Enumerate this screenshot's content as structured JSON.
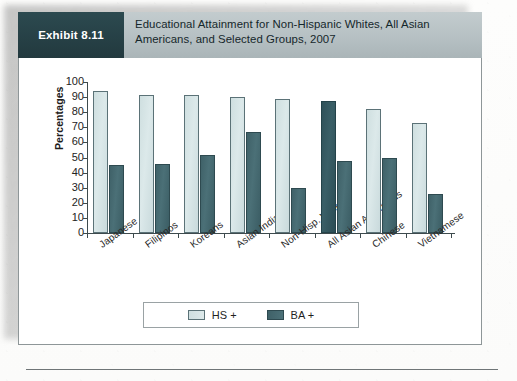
{
  "exhibit": {
    "badge_label": "Exhibit 8.11",
    "title": "Educational Attainment for Non-Hispanic Whites, All Asian Americans, and Selected Groups, 2007"
  },
  "legend": {
    "items": [
      {
        "label": "HS +",
        "series": "hs",
        "color": "#d4e3e4"
      },
      {
        "label": "BA +",
        "series": "ba",
        "color": "#456a71"
      }
    ]
  },
  "chart_data": {
    "type": "bar",
    "title": "Educational Attainment for Non-Hispanic Whites, All Asian Americans, and Selected Groups, 2007",
    "xlabel": "",
    "ylabel": "Percentages",
    "ylim": [
      0,
      100
    ],
    "yticks": [
      0,
      10,
      20,
      30,
      40,
      50,
      60,
      70,
      80,
      90,
      100
    ],
    "grid": false,
    "legend_position": "bottom-center",
    "categories": [
      "Japanese",
      "Filipinos",
      "Koreans",
      "Asian Indians",
      "Non-Hisp. Whites",
      "All Asian Americans",
      "Chinese",
      "Vietnamese"
    ],
    "series": [
      {
        "name": "HS +",
        "color": "#d4e3e4",
        "values": [
          94,
          91.5,
          91.5,
          90,
          89,
          87.5,
          82,
          73
        ]
      },
      {
        "name": "BA +",
        "color": "#456a71",
        "values": [
          45,
          46,
          51.5,
          67,
          30,
          48,
          50,
          26
        ]
      }
    ]
  }
}
